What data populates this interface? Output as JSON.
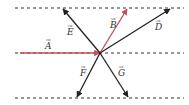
{
  "diagram": {
    "center": [
      100,
      53
    ],
    "dashed_lines_y": [
      8,
      53,
      98
    ],
    "colors": {
      "red": "#c0505a",
      "black": "#222222",
      "dash": "#333333"
    },
    "vectors": [
      {
        "name": "A",
        "label": "A",
        "from": [
          20,
          53
        ],
        "to": [
          100,
          53
        ],
        "color": "red",
        "label_pos": [
          45,
          49
        ]
      },
      {
        "name": "B",
        "label": "B",
        "from": [
          100,
          53
        ],
        "to": [
          127,
          9
        ],
        "color": "red",
        "label_pos": [
          110,
          28
        ]
      },
      {
        "name": "D",
        "label": "D",
        "from": [
          100,
          53
        ],
        "to": [
          170,
          9
        ],
        "color": "black",
        "label_pos": [
          155,
          30
        ]
      },
      {
        "name": "E",
        "label": "E",
        "from": [
          100,
          53
        ],
        "to": [
          63,
          9
        ],
        "color": "black",
        "label_pos": [
          67,
          35
        ]
      },
      {
        "name": "F",
        "label": "F",
        "from": [
          100,
          53
        ],
        "to": [
          77,
          97
        ],
        "color": "black",
        "label_pos": [
          80,
          76
        ]
      },
      {
        "name": "G",
        "label": "G",
        "from": [
          100,
          53
        ],
        "to": [
          128,
          97
        ],
        "color": "black",
        "label_pos": [
          118,
          76
        ]
      }
    ]
  }
}
